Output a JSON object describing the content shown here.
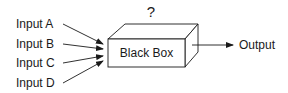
{
  "diagram": {
    "question_mark": "?",
    "box_label": "Black Box",
    "inputs": [
      {
        "label": "Input A"
      },
      {
        "label": "Input B"
      },
      {
        "label": "Input C"
      },
      {
        "label": "Input D"
      }
    ],
    "output_label": "Output",
    "colors": {
      "stroke": "#1a1a1a",
      "fill": "#ffffff"
    }
  }
}
